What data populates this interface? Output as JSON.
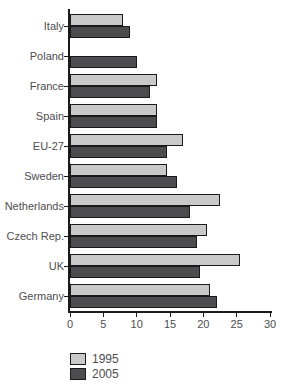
{
  "figure": {
    "background": "#ffffff",
    "text_color": "#4d4d4f",
    "axis_color": "#1a1a1a",
    "bar_border_color": "#1a1a1a"
  },
  "chart_data": {
    "type": "bar",
    "orientation": "horizontal",
    "title": "",
    "xlabel": "",
    "ylabel": "",
    "categories": [
      "Italy",
      "Poland",
      "France",
      "Spain",
      "EU-27",
      "Sweden",
      "Netherlands",
      "Czech Rep.",
      "UK",
      "Germany"
    ],
    "series": [
      {
        "name": "1995",
        "color": "#c9c9c9",
        "values": [
          8,
          null,
          13,
          13,
          17,
          14.5,
          22.5,
          20.5,
          25.5,
          21
        ]
      },
      {
        "name": "2005",
        "color": "#4d4d4f",
        "values": [
          9,
          10,
          12,
          13,
          14.5,
          16,
          18,
          19,
          19.5,
          22
        ]
      }
    ],
    "xlim": [
      0,
      30
    ],
    "xticks": [
      0,
      5,
      10,
      15,
      20,
      25,
      30
    ],
    "grid": false,
    "legend_position": "bottom-left"
  },
  "legend": {
    "items": [
      {
        "label": "1995",
        "color": "#c9c9c9"
      },
      {
        "label": "2005",
        "color": "#4d4d4f"
      }
    ]
  }
}
